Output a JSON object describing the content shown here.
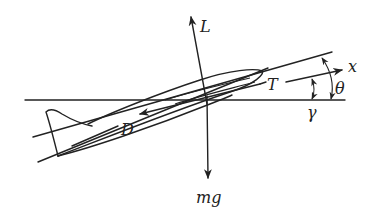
{
  "diagram": {
    "type": "free-body diagram of aircraft in climb",
    "labels": {
      "lift": "L",
      "weight": "mg",
      "thrust": "T",
      "drag": "D",
      "body_axis": "x",
      "pitch_angle": "θ",
      "flight_path_angle": "γ"
    },
    "colors": {
      "ink": "#222222",
      "background": "#ffffff"
    }
  }
}
